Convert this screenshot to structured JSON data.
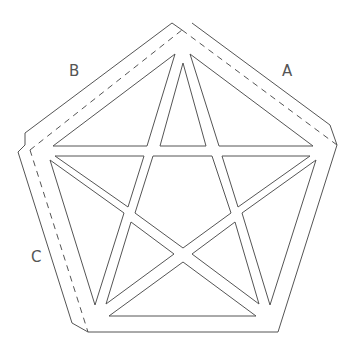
{
  "diagram": {
    "labels": {
      "a": "A",
      "b": "B",
      "c": "C"
    },
    "colors": {
      "line": "#555555",
      "background": "#ffffff"
    }
  }
}
